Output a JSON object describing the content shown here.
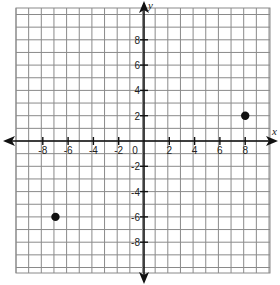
{
  "chart_data": {
    "type": "scatter",
    "title": "",
    "xlabel": "x",
    "ylabel": "y",
    "xlim": [
      -10,
      10
    ],
    "ylim": [
      -10,
      10
    ],
    "grid": true,
    "x_tick_labels": [
      "-8",
      "-6",
      "-4",
      "-2",
      "0",
      "2",
      "4",
      "6",
      "8"
    ],
    "x_ticks": [
      -8,
      -6,
      -4,
      -2,
      0,
      2,
      4,
      6,
      8
    ],
    "y_tick_labels": [
      "8",
      "6",
      "4",
      "2",
      "-2",
      "-4",
      "-6",
      "-8"
    ],
    "y_ticks": [
      8,
      6,
      4,
      2,
      -2,
      -4,
      -6,
      -8
    ],
    "series": [
      {
        "name": "points",
        "points": [
          {
            "x": 8,
            "y": 2
          },
          {
            "x": -7,
            "y": -6
          }
        ]
      }
    ],
    "colors": {
      "grid": "#8a8a8a",
      "axis": "#111111",
      "point": "#111111"
    }
  }
}
